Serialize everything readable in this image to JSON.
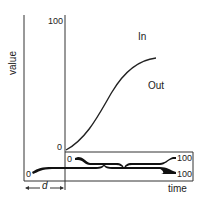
{
  "diagram": {
    "y_axis_label": "value",
    "x_axis_label": "time",
    "inner_y_max": "100",
    "inner_y_min": "0",
    "curve_label_in": "In",
    "curve_label_out": "Out",
    "inner_range_start": "0",
    "inner_range_end": "100",
    "outer_range_start": "0",
    "outer_range_end": "100",
    "delay_label": "d",
    "colors": {
      "line": "#222222",
      "background": "#ffffff"
    }
  }
}
